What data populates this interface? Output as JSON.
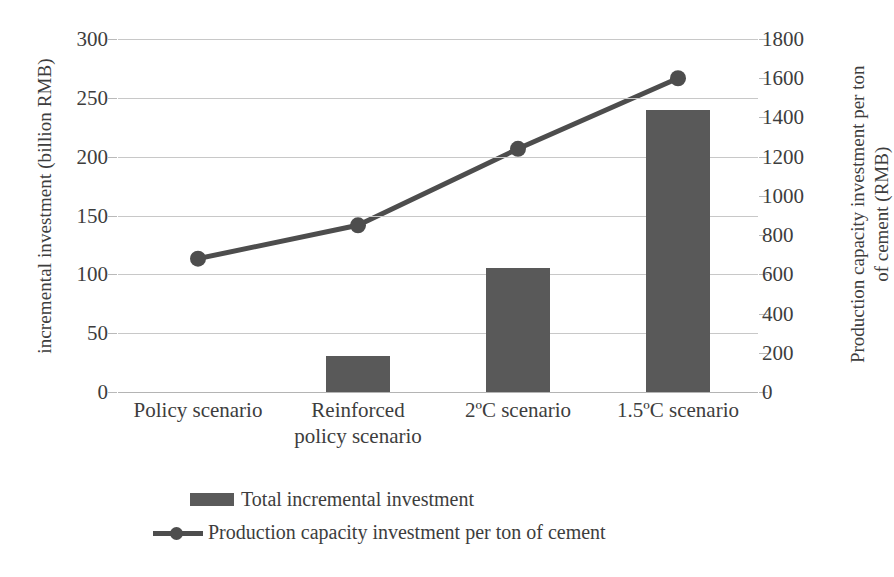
{
  "chart_data": {
    "type": "bar",
    "title": "",
    "xlabel": "",
    "categories": [
      "Policy scenario",
      "Reinforced policy scenario",
      "2ºC scenario",
      "1.5ºC scenario"
    ],
    "category_lines": [
      [
        "Policy scenario"
      ],
      [
        "Reinforced",
        "policy scenario"
      ],
      [
        "2ºC scenario"
      ],
      [
        "1.5ºC scenario"
      ]
    ],
    "series": [
      {
        "name": "Total incremental investment",
        "type": "bar",
        "axis": "left",
        "unit": "billion RMB",
        "color": "#595959",
        "values": [
          0,
          31,
          105,
          240
        ]
      },
      {
        "name": "Production capacity investment per ton of cement",
        "type": "line",
        "axis": "right",
        "unit": "RMB",
        "color": "#4d4d4d",
        "marker": "circle",
        "values": [
          680,
          850,
          1240,
          1600
        ]
      }
    ],
    "left_axis": {
      "label": "incremental investment (billion RMB)",
      "ylim": [
        0,
        300
      ],
      "tick_step": 50,
      "ticks": [
        "300",
        "250",
        "200",
        "150",
        "100",
        "50",
        "0"
      ],
      "tick_values": [
        300,
        250,
        200,
        150,
        100,
        50,
        0
      ]
    },
    "right_axis": {
      "label_line1": "Production capacity investment per ton",
      "label_line2": "of cement  (RMB)",
      "label": "Production capacity investment per ton of cement  (RMB)",
      "ylim": [
        0,
        1800
      ],
      "tick_step": 200,
      "ticks": [
        "1800",
        "1600",
        "1400",
        "1200",
        "1000",
        "800",
        "600",
        "400",
        "200",
        "0"
      ],
      "tick_values": [
        1800,
        1600,
        1400,
        1200,
        1000,
        800,
        600,
        400,
        200,
        0
      ]
    },
    "grid": true,
    "legend_position": "bottom",
    "legend": [
      {
        "label": "Total incremental investment",
        "marker": "bar-swatch"
      },
      {
        "label": "Production capacity investment per ton of cement",
        "marker": "line-circle-swatch"
      }
    ],
    "colors": {
      "bar": "#595959",
      "line": "#4d4d4d",
      "grid": "#c8c8c8",
      "text": "#3d3d3d",
      "background": "#ffffff"
    }
  }
}
